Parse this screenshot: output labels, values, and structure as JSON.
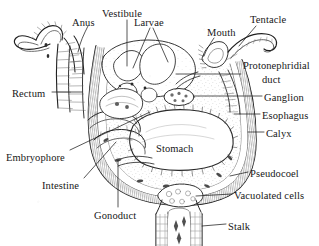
{
  "figure": {
    "kind": "anatomical-diagram",
    "width": 319,
    "height": 246,
    "background_color": "#ffffff",
    "ink_color": "#222222",
    "style": "scanned black-and-white line drawing with hatching"
  },
  "labels": [
    {
      "id": "anus",
      "text": "Anus",
      "x": 72,
      "y": 17,
      "align": "left"
    },
    {
      "id": "vestibule",
      "text": "Vestibule",
      "x": 102,
      "y": 8,
      "align": "left"
    },
    {
      "id": "larvae",
      "text": "Larvae",
      "x": 134,
      "y": 17,
      "align": "left"
    },
    {
      "id": "mouth",
      "text": "Mouth",
      "x": 207,
      "y": 27,
      "align": "left"
    },
    {
      "id": "tentacle",
      "text": "Tentacle",
      "x": 250,
      "y": 14,
      "align": "left"
    },
    {
      "id": "protonephridial",
      "text": "Protonephridial",
      "x": 243,
      "y": 60,
      "align": "left"
    },
    {
      "id": "duct",
      "text": "duct",
      "x": 262,
      "y": 74,
      "align": "left"
    },
    {
      "id": "ganglion",
      "text": "Ganglion",
      "x": 264,
      "y": 92,
      "align": "left"
    },
    {
      "id": "esophagus",
      "text": "Esophagus",
      "x": 262,
      "y": 110,
      "align": "left"
    },
    {
      "id": "calyx",
      "text": "Calyx",
      "x": 266,
      "y": 128,
      "align": "left"
    },
    {
      "id": "rectum",
      "text": "Rectum",
      "x": 12,
      "y": 88,
      "align": "left"
    },
    {
      "id": "embryophore",
      "text": "Embryophore",
      "x": 6,
      "y": 152,
      "align": "left"
    },
    {
      "id": "intestine",
      "text": "Intestine",
      "x": 42,
      "y": 180,
      "align": "left"
    },
    {
      "id": "gonoduct",
      "text": "Gonoduct",
      "x": 94,
      "y": 210,
      "align": "left"
    },
    {
      "id": "stomach",
      "text": "Stomach",
      "x": 156,
      "y": 143,
      "align": "left"
    },
    {
      "id": "pseudocoel",
      "text": "Pseudocoel",
      "x": 250,
      "y": 168,
      "align": "left"
    },
    {
      "id": "vacuolated",
      "text": "Vacuolated cells",
      "x": 234,
      "y": 190,
      "align": "left"
    },
    {
      "id": "stalk",
      "text": "Stalk",
      "x": 228,
      "y": 221,
      "align": "left"
    }
  ],
  "structures": [
    "calyx-body-wall",
    "tentacle-crown",
    "vestibule-cavity",
    "larvae-brood",
    "mouth-opening",
    "anus-opening",
    "rectum-tube",
    "esophagus-tube",
    "stomach-cavity",
    "intestine-loop",
    "ganglion-mass",
    "protonephridial-duct",
    "gonoduct-tube",
    "embryophore-mass",
    "pseudocoel-space",
    "vacuolated-cells",
    "stalk-column"
  ]
}
